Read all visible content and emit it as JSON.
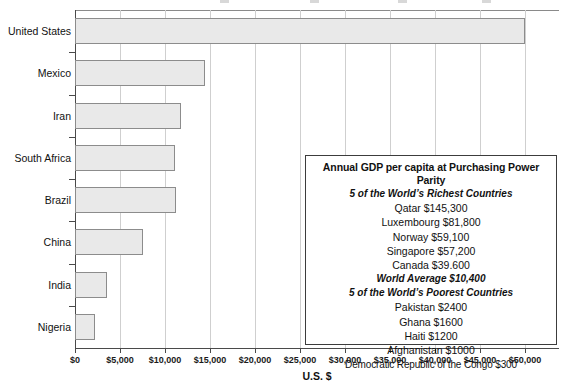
{
  "chart_data": {
    "type": "bar",
    "orientation": "horizontal",
    "title": "",
    "xlabel": "U.S. $",
    "ylabel": "",
    "xlim": [
      0,
      50000
    ],
    "xtick_values": [
      0,
      5000,
      10000,
      15000,
      20000,
      25000,
      30000,
      35000,
      40000,
      45000,
      50000
    ],
    "xtick_labels": [
      "$0",
      "$5,000",
      "$10,000",
      "$15,000",
      "$20,000",
      "$25,000",
      "$30,000",
      "$35,000",
      "$40,000",
      "$45,000",
      "$50,000"
    ],
    "grid": true,
    "legend": "none",
    "categories": [
      "United States",
      "Mexico",
      "Iran",
      "South Africa",
      "Brazil",
      "China",
      "India",
      "Nigeria"
    ],
    "values": [
      50000,
      14400,
      11800,
      11100,
      11200,
      7500,
      3500,
      2200
    ],
    "bar_fill": "#e9e9e9",
    "bar_border": "#8c8c8c"
  },
  "axis": {
    "x_title": "U.S. $"
  },
  "annotation": {
    "heading": "Annual GDP per capita at Purchasing Power Parity",
    "richest_heading": "5 of the World’s Richest Countries",
    "richest": [
      "Qatar $145,300",
      "Luxembourg $81,800",
      "Norway $59,100",
      "Singapore $57,200",
      "Canada $39.600"
    ],
    "world_average": "World Average $10,400",
    "poorest_heading": "5 of the World’s Poorest Countries",
    "poorest": [
      "Pakistan $2400",
      "Ghana $1600",
      "Haiti $1200",
      "Afghanistan $1000",
      "Democratic Republic of the Congo $300"
    ]
  }
}
